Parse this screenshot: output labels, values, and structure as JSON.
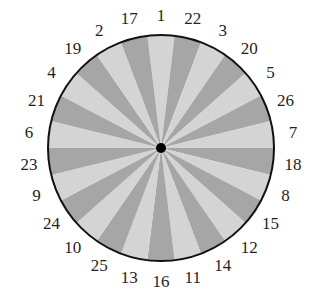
{
  "diagram": {
    "type": "spinner-wheel",
    "sector_count": 26,
    "labels_clockwise_from_top": [
      "1",
      "22",
      "3",
      "20",
      "5",
      "26",
      "7",
      "18",
      "8",
      "15",
      "12",
      "14",
      "11",
      "16",
      "13",
      "25",
      "10",
      "24",
      "9",
      "23",
      "6",
      "21",
      "4",
      "19",
      "2",
      "17"
    ],
    "colors": {
      "light_sector": "#d4d4d4",
      "dark_sector": "#a6a6a6",
      "outline": "#111111",
      "center_dot": "#000000",
      "label_text": "#1f1f1f",
      "background": "#ffffff"
    },
    "geometry": {
      "center_x": 161,
      "center_y": 148,
      "radius": 113,
      "label_radius": 133,
      "center_dot_radius": 5
    }
  }
}
